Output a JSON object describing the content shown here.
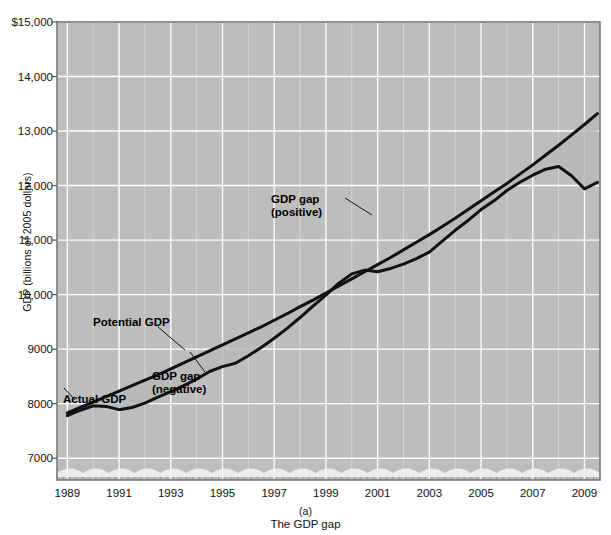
{
  "chart_data": {
    "type": "line",
    "title": "",
    "caption_label": "(a)",
    "caption_text": "The GDP gap",
    "xlabel": "",
    "ylabel": "GDP (billions of 2005 dollars)",
    "xlim": [
      1988.6,
      2009.6
    ],
    "ylim": [
      6600,
      15000
    ],
    "grid": true,
    "legend": "none",
    "xticks": [
      "1989",
      "1991",
      "1993",
      "1995",
      "1997",
      "1999",
      "2001",
      "2003",
      "2005",
      "2007",
      "2009"
    ],
    "xtick_values": [
      1989,
      1991,
      1993,
      1995,
      1997,
      1999,
      2001,
      2003,
      2005,
      2007,
      2009
    ],
    "yticks": [
      "$15,000",
      "14,000",
      "13,000",
      "12,000",
      "11,000",
      "10,000",
      "9000",
      "8000",
      "7000"
    ],
    "ytick_values": [
      15000,
      14000,
      13000,
      12000,
      11000,
      10000,
      9000,
      8000,
      7000
    ],
    "x": [
      1989.0,
      1989.5,
      1990.0,
      1990.5,
      1991.0,
      1991.5,
      1992.0,
      1992.5,
      1993.0,
      1993.5,
      1994.0,
      1994.5,
      1995.0,
      1995.5,
      1996.0,
      1996.5,
      1997.0,
      1997.5,
      1998.0,
      1998.5,
      1999.0,
      1999.5,
      2000.0,
      2000.5,
      2001.0,
      2001.5,
      2002.0,
      2002.5,
      2003.0,
      2003.5,
      2004.0,
      2004.5,
      2005.0,
      2005.5,
      2006.0,
      2006.5,
      2007.0,
      2007.5,
      2008.0,
      2008.5,
      2009.0,
      2009.5
    ],
    "series": [
      {
        "name": "Actual GDP",
        "color": "#111111",
        "values": [
          7780,
          7880,
          7960,
          7950,
          7890,
          7930,
          8010,
          8120,
          8220,
          8330,
          8450,
          8590,
          8680,
          8740,
          8880,
          9030,
          9200,
          9380,
          9580,
          9790,
          9990,
          10210,
          10380,
          10450,
          10420,
          10480,
          10560,
          10660,
          10780,
          10980,
          11180,
          11360,
          11560,
          11720,
          11910,
          12060,
          12190,
          12300,
          12350,
          12180,
          11940,
          12060
        ],
        "values_scaled_note": "rendered via plot mapping"
      },
      {
        "name": "Potential GDP",
        "color": "#111111",
        "values": [
          7830,
          7930,
          8030,
          8130,
          8230,
          8330,
          8430,
          8530,
          8640,
          8750,
          8860,
          8970,
          9080,
          9190,
          9300,
          9410,
          9530,
          9650,
          9780,
          9900,
          10030,
          10160,
          10290,
          10420,
          10550,
          10680,
          10820,
          10960,
          11100,
          11250,
          11400,
          11560,
          11720,
          11880,
          12040,
          12210,
          12380,
          12560,
          12740,
          12930,
          13120,
          13320
        ]
      }
    ],
    "annotations": [
      {
        "id": "gap-positive",
        "text_line1": "GDP gap",
        "text_line2": "(positive)",
        "x": 1999.0,
        "y": 11500
      },
      {
        "id": "potential-gdp",
        "text_line1": "Potential GDP",
        "text_line2": "",
        "x": 1992.5,
        "y": 9250
      },
      {
        "id": "actual-gdp",
        "text_line1": "Actual GDP",
        "text_line2": "",
        "x": 1989.5,
        "y": 7500
      },
      {
        "id": "gap-negative",
        "text_line1": "GDP gap",
        "text_line2": "(negative)",
        "x": 1993.5,
        "y": 7950
      }
    ],
    "shaded_regions": [
      {
        "name": "positive-gap-fill",
        "color": "#b9b9b9",
        "from_x": 1996.8,
        "to_x": 2001.2
      },
      {
        "name": "negative-gap-fill",
        "color": "#b9b9b9",
        "from_x": 1989.0,
        "to_x": 1996.8
      }
    ],
    "plot_background": "#bdbdbd",
    "gridline_color": "#ffffff",
    "axis_color": "#7a7a7a"
  },
  "figure": {
    "ylabel": "GDP (billions of 2005 dollars)",
    "caption_label": "(a)",
    "caption_text": "The GDP gap",
    "top_partial_text": ""
  },
  "annotations": {
    "gap_positive_l1": "GDP gap",
    "gap_positive_l2": "(positive)",
    "potential_gdp": "Potential GDP",
    "actual_gdp": "Actual GDP",
    "gap_negative_l1": "GDP gap",
    "gap_negative_l2": "(negative)"
  }
}
